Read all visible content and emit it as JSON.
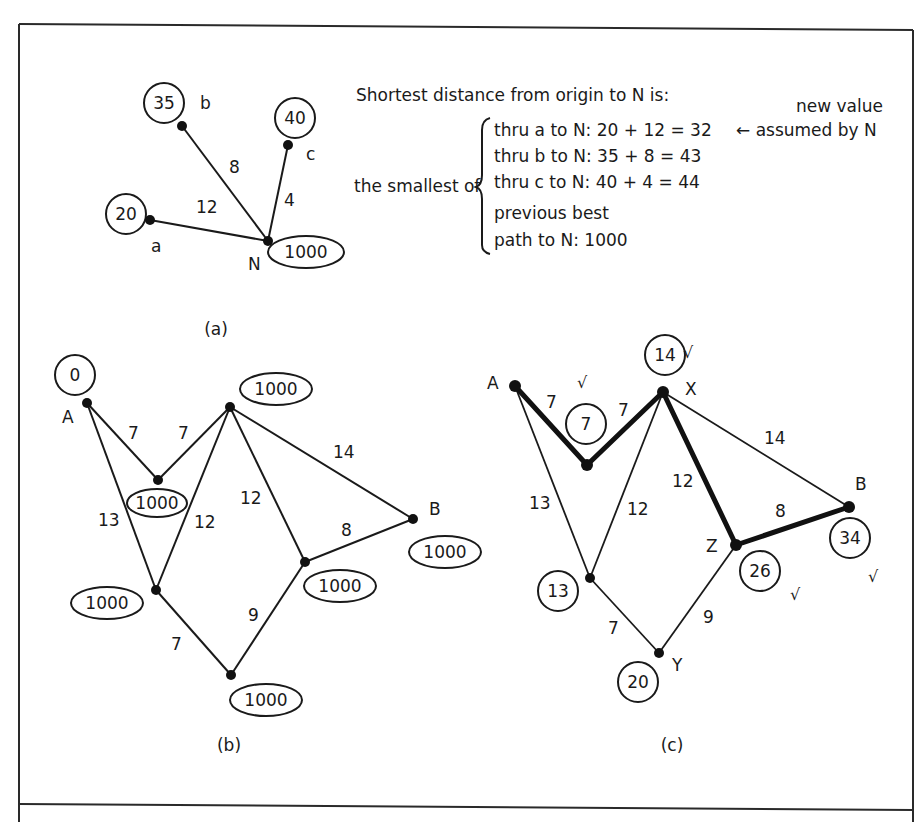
{
  "figure": {
    "panels": [
      "(a)",
      "(b)",
      "(c)"
    ]
  },
  "panel_a": {
    "caption": "(a)",
    "nodes": {
      "a": {
        "name": "a",
        "value": "20"
      },
      "b": {
        "name": "b",
        "value": "35"
      },
      "c": {
        "name": "c",
        "value": "40"
      },
      "N": {
        "name": "N",
        "value": "1000"
      }
    },
    "edges": {
      "aN": "12",
      "bN": "8",
      "cN": "4"
    },
    "explanation": {
      "heading": "Shortest distance from origin to N is:",
      "lead": "the smallest of",
      "lines": [
        "thru a to N: 20 + 12 = 32",
        "thru b to N: 35 + 8 = 43",
        "thru c to N: 40 + 4 = 44",
        "previous best",
        "path to N: 1000"
      ],
      "note_line1": "new value",
      "note_line2": "← assumed by N"
    }
  },
  "panel_b": {
    "caption": "(b)",
    "node_labels": {
      "A": "A",
      "B": "B"
    },
    "values": {
      "A": "0",
      "P": "1000",
      "X": "1000",
      "Q": "1000",
      "Z": "1000",
      "B": "1000",
      "Y": "1000"
    },
    "edges": {
      "AP": "7",
      "PX": "7",
      "AQ": "13",
      "XQ": "12",
      "XZ": "12",
      "XB": "14",
      "ZB": "8",
      "QY": "7",
      "YZ": "9"
    }
  },
  "panel_c": {
    "caption": "(c)",
    "node_labels": {
      "A": "A",
      "X": "X",
      "B": "B",
      "Z": "Z",
      "Y": "Y"
    },
    "values": {
      "P": "7",
      "X": "14",
      "Q": "13",
      "Z": "26",
      "B": "34",
      "Y": "20"
    },
    "edges": {
      "AP": "7",
      "PX": "7",
      "AQ": "13",
      "XQ": "12",
      "XZ": "12",
      "XB": "14",
      "ZB": "8",
      "QY": "7",
      "YZ": "9"
    },
    "shortest_path": [
      "A",
      "P",
      "X",
      "Z",
      "B"
    ],
    "check_mark": "√"
  }
}
